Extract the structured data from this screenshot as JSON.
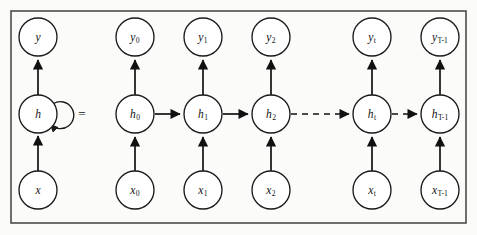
{
  "figure": {
    "background_color": "#fbfbfa",
    "frame_color": "#4d4d4d",
    "node_fill": "#ffffff",
    "node_stroke": "#1a1a1a",
    "edge_color": "#111111",
    "equals_symbol": "=",
    "frame": {
      "x": 11,
      "y": 11,
      "width": 455,
      "height": 212
    }
  },
  "geometry": {
    "radius": 19,
    "row_y": {
      "output": 37,
      "hidden": 114,
      "input": 190
    },
    "columns_x": [
      38,
      135,
      203,
      271,
      372,
      440
    ]
  },
  "folded": {
    "caption": "folded recurrent cell",
    "nodes": {
      "output": {
        "label": "y",
        "sub": "",
        "cx": 38,
        "cy": 37
      },
      "hidden": {
        "label": "h",
        "sub": "",
        "cx": 38,
        "cy": 114
      },
      "input": {
        "label": "x",
        "sub": "",
        "cx": 38,
        "cy": 190
      }
    },
    "self_loop": {
      "present": true,
      "description": "recurrent self connection on hidden unit"
    }
  },
  "unfolded": {
    "caption": "time unrolled sequence",
    "timesteps": [
      {
        "index": 0,
        "cx": 135,
        "output_label": "y",
        "output_sub": "0",
        "hidden_label": "h",
        "hidden_sub": "0",
        "input_label": "x",
        "input_sub": "0"
      },
      {
        "index": 1,
        "cx": 203,
        "output_label": "y",
        "output_sub": "1",
        "hidden_label": "h",
        "hidden_sub": "1",
        "input_label": "x",
        "input_sub": "1"
      },
      {
        "index": 2,
        "cx": 271,
        "output_label": "y",
        "output_sub": "2",
        "hidden_label": "h",
        "hidden_sub": "2",
        "input_label": "x",
        "input_sub": "2"
      },
      {
        "index": 3,
        "cx": 372,
        "output_label": "y",
        "output_sub": "t",
        "hidden_label": "h",
        "hidden_sub": "t",
        "input_label": "x",
        "input_sub": "t"
      },
      {
        "index": 4,
        "cx": 440,
        "output_label": "y",
        "output_sub": "T-1",
        "hidden_label": "h",
        "hidden_sub": "T-1",
        "input_label": "x",
        "input_sub": "T-1"
      }
    ],
    "hidden_links": [
      {
        "from": 0,
        "to": 1,
        "style": "solid"
      },
      {
        "from": 1,
        "to": 2,
        "style": "solid"
      },
      {
        "from": 2,
        "to": 3,
        "style": "dashed"
      },
      {
        "from": 3,
        "to": 4,
        "style": "dashed"
      }
    ]
  }
}
